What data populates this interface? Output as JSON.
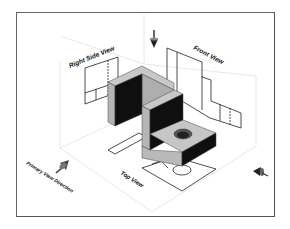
{
  "figure": {
    "labels": {
      "right_side_view": "Right Side View",
      "front_view": "Front View",
      "top_view": "Top View",
      "primary_view_direction": "Primary View Direction"
    },
    "icons": [
      "view-arrow-down-icon",
      "view-arrow-primary-icon",
      "view-arrow-side-icon"
    ],
    "colors": {
      "frame": "#555555",
      "plane_lines": "#dddddd",
      "solid_light": "#bdbdbd",
      "solid_top": "#c8c8c8",
      "solid_dark": "#0d0d0d",
      "projection_lines": "#222222"
    }
  }
}
